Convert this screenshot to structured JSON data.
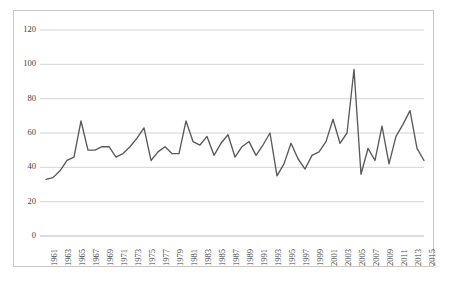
{
  "chart_data": {
    "type": "line",
    "title": "",
    "subtitle": "",
    "xlabel": "",
    "ylabel": "",
    "ylim": [
      0,
      120
    ],
    "xlim": [
      1961,
      2015
    ],
    "grid": "horizontal",
    "legend": "none",
    "line_color": "#595959",
    "annotations": [],
    "y_ticks": [
      0,
      20,
      40,
      60,
      80,
      100,
      120
    ],
    "y_tick_labels": [
      "0",
      "20",
      "40",
      "60",
      "80",
      "100",
      "120"
    ],
    "x_tick_labels": [
      "1961",
      "1963",
      "1965",
      "1967",
      "1969",
      "1971",
      "1973",
      "1975",
      "1977",
      "1979",
      "1981",
      "1983",
      "1985",
      "1987",
      "1989",
      "1991",
      "1993",
      "1995",
      "1997",
      "1999",
      "2001",
      "2003",
      "2005",
      "2007",
      "2009",
      "2011",
      "2013",
      "2015"
    ],
    "x": [
      1961,
      1962,
      1963,
      1964,
      1965,
      1966,
      1967,
      1968,
      1969,
      1970,
      1971,
      1972,
      1973,
      1974,
      1975,
      1976,
      1977,
      1978,
      1979,
      1980,
      1981,
      1982,
      1983,
      1984,
      1985,
      1986,
      1987,
      1988,
      1989,
      1990,
      1991,
      1992,
      1993,
      1994,
      1995,
      1996,
      1997,
      1998,
      1999,
      2000,
      2001,
      2002,
      2003,
      2004,
      2005,
      2006,
      2007,
      2008,
      2009,
      2010,
      2011,
      2012,
      2013,
      2014,
      2015
    ],
    "values": [
      33,
      34,
      38,
      44,
      46,
      67,
      50,
      50,
      52,
      52,
      46,
      48,
      52,
      57,
      63,
      44,
      49,
      52,
      48,
      48,
      67,
      55,
      53,
      58,
      47,
      54,
      59,
      46,
      52,
      55,
      47,
      53,
      60,
      35,
      42,
      54,
      45,
      39,
      47,
      49,
      55,
      68,
      54,
      60,
      97,
      36,
      51,
      44,
      64,
      42,
      58,
      65,
      73,
      51,
      44
    ],
    "series": [
      {
        "name": "series-1",
        "values": [
          33,
          34,
          38,
          44,
          46,
          67,
          50,
          50,
          52,
          52,
          46,
          48,
          52,
          57,
          63,
          44,
          49,
          52,
          48,
          48,
          67,
          55,
          53,
          58,
          47,
          54,
          59,
          46,
          52,
          55,
          47,
          53,
          60,
          35,
          42,
          54,
          45,
          39,
          47,
          49,
          55,
          68,
          54,
          60,
          97,
          36,
          51,
          44,
          64,
          42,
          58,
          65,
          73,
          51,
          44
        ]
      }
    ]
  }
}
